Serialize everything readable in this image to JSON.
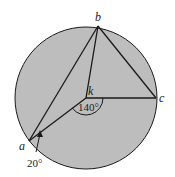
{
  "diagram": {
    "points": {
      "a": "a",
      "b": "b",
      "c": "c",
      "k": "k"
    },
    "angles": {
      "central_angle": "140°",
      "inscribed_angle": "20°"
    },
    "colors": {
      "circle_fill": "#bdbdbd",
      "stroke": "#1a1a1a",
      "background": "#ffffff"
    }
  }
}
